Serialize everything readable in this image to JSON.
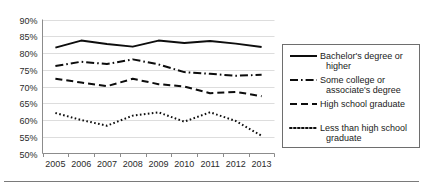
{
  "chart_data": {
    "type": "line",
    "title": "",
    "xlabel": "",
    "ylabel": "",
    "x": [
      2005,
      2006,
      2007,
      2008,
      2009,
      2010,
      2011,
      2012,
      2013
    ],
    "categories": [
      "2005",
      "2006",
      "2007",
      "2008",
      "2009",
      "2010",
      "2011",
      "2012",
      "2013"
    ],
    "ylim": [
      50,
      90
    ],
    "ytick_labels": [
      "90%",
      "85%",
      "80%",
      "75%",
      "70%",
      "65%",
      "60%",
      "55%",
      "50%"
    ],
    "ytick_values": [
      90,
      85,
      80,
      75,
      70,
      65,
      60,
      55,
      50
    ],
    "grid": true,
    "legend_position": "right",
    "series": [
      {
        "name": "Bachelor's degree or higher",
        "style": "solid",
        "values": [
          81.6,
          83.7,
          82.7,
          81.9,
          83.7,
          83.0,
          83.6,
          82.8,
          81.8
        ]
      },
      {
        "name": "Some college or associate's degree",
        "style": "dash-dot",
        "values": [
          76.1,
          77.4,
          76.7,
          78.1,
          76.6,
          74.3,
          73.8,
          73.2,
          73.5
        ]
      },
      {
        "name": "High school graduate",
        "style": "dashed",
        "values": [
          72.3,
          71.2,
          70.1,
          72.3,
          70.7,
          70.0,
          68.0,
          68.4,
          67.1
        ]
      },
      {
        "name": "Less than high school graduate",
        "style": "dotted",
        "values": [
          62.1,
          60.0,
          58.3,
          61.3,
          62.3,
          59.5,
          62.3,
          59.7,
          55.3
        ]
      }
    ]
  },
  "legend": {
    "items": [
      {
        "label_line1": "Bachelor's degree or",
        "label_line2": "higher",
        "style": "solid"
      },
      {
        "label_line1": "Some college or",
        "label_line2": "associate's degree",
        "style": "dash-dot"
      },
      {
        "label_line1": "High school graduate",
        "label_line2": "",
        "style": "dashed"
      },
      {
        "label_line1": "Less than high school",
        "label_line2": "graduate",
        "style": "dotted"
      }
    ]
  },
  "axes": {
    "y_labels": [
      "90%",
      "85%",
      "80%",
      "75%",
      "70%",
      "65%",
      "60%",
      "55%",
      "50%"
    ],
    "x_labels": [
      "2005",
      "2006",
      "2007",
      "2008",
      "2009",
      "2010",
      "2011",
      "2012",
      "2013"
    ]
  },
  "colors": {
    "line": "#0d0d0d",
    "grid": "#d4d4d4",
    "axis": "#8c8c8c",
    "text": "#2b2b2b",
    "background": "#ffffff"
  }
}
